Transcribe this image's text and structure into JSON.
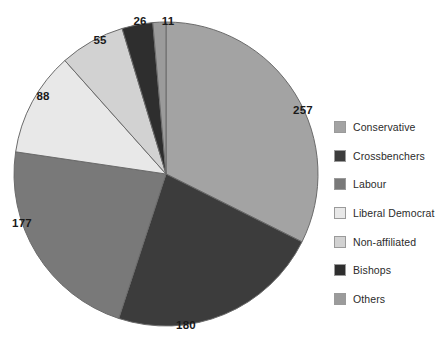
{
  "chart_data": {
    "type": "pie",
    "title": "",
    "subtitle": "",
    "xlabel": "",
    "ylabel": "",
    "total": 794,
    "start_angle_deg": 0,
    "direction": "clockwise",
    "grid": false,
    "legend_position": "right",
    "categories": [
      "Conservative",
      "Crossbenchers",
      "Labour",
      "Liberal Democrat",
      "Non-affiliated",
      "Bishops",
      "Others"
    ],
    "values": [
      257,
      180,
      177,
      88,
      55,
      26,
      11
    ],
    "colors": [
      "#a3a3a3",
      "#3c3c3c",
      "#797979",
      "#e8e8e8",
      "#d2d2d2",
      "#2e2e2e",
      "#9b9b9b"
    ],
    "slices": [
      {
        "label": "Conservative",
        "value": 257,
        "color": "#a3a3a3",
        "label_x": 303,
        "label_y": 110
      },
      {
        "label": "Crossbenchers",
        "value": 180,
        "color": "#3c3c3c",
        "label_x": 186,
        "label_y": 325
      },
      {
        "label": "Labour",
        "value": 177,
        "color": "#797979",
        "label_x": 22,
        "label_y": 223
      },
      {
        "label": "Liberal Democrat",
        "value": 88,
        "color": "#e8e8e8",
        "label_x": 43,
        "label_y": 96
      },
      {
        "label": "Non-affiliated",
        "value": 55,
        "color": "#d2d2d2",
        "label_x": 100,
        "label_y": 40
      },
      {
        "label": "Bishops",
        "value": 26,
        "color": "#2e2e2e",
        "label_x": 140,
        "label_y": 21
      },
      {
        "label": "Others",
        "value": 11,
        "color": "#9b9b9b",
        "label_x": 168,
        "label_y": 21
      }
    ]
  },
  "legend": {
    "items": [
      {
        "label": "Conservative",
        "color": "#a3a3a3"
      },
      {
        "label": "Crossbenchers",
        "color": "#3c3c3c"
      },
      {
        "label": "Labour",
        "color": "#797979"
      },
      {
        "label": "Liberal Democrat",
        "color": "#e8e8e8"
      },
      {
        "label": "Non-affiliated",
        "color": "#d2d2d2"
      },
      {
        "label": "Bishops",
        "color": "#2e2e2e"
      },
      {
        "label": "Others",
        "color": "#9b9b9b"
      }
    ]
  }
}
